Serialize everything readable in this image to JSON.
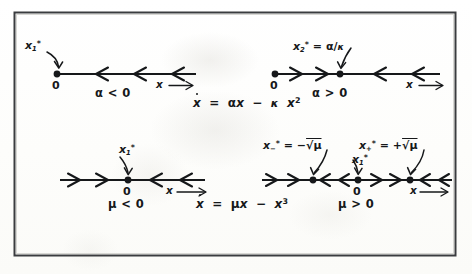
{
  "figure": {
    "background_color": "#fdfdfc",
    "ink_color": "#16181a",
    "frame": {
      "stroke_color": "#3a3c3f",
      "x": 14,
      "y": 12,
      "width": 441,
      "height": 243
    }
  },
  "panels": [
    {
      "id": "transcritical-negative",
      "equation": "ẋ = αx − κ x²",
      "condition": "α < 0",
      "axis_label": "x",
      "axis_arrow": "→",
      "origin_label": "0",
      "fixed_points": [
        {
          "name": "x₁*",
          "base": "x",
          "sub": "1",
          "star": "*",
          "value_text": "",
          "x_px": 57,
          "stability": "stable"
        }
      ],
      "flow_arrows": [
        {
          "direction": "left",
          "x_px": 100
        },
        {
          "direction": "left",
          "x_px": 135
        },
        {
          "direction": "left",
          "x_px": 170
        }
      ],
      "line": {
        "x_start": 57,
        "x_end": 196,
        "y": 74
      }
    },
    {
      "id": "transcritical-positive",
      "equation": "",
      "condition": "α > 0",
      "axis_label": "x",
      "axis_arrow": "→",
      "origin_label": "0",
      "fixed_points": [
        {
          "name": "0",
          "base": "",
          "sub": "",
          "star": "",
          "value_text": "",
          "x_px": 275,
          "stability": "unstable"
        },
        {
          "name": "x₂* = α/κ",
          "base": "x",
          "sub": "2",
          "star": "*",
          "value_text": "= α/κ",
          "x_px": 340,
          "stability": "stable"
        }
      ],
      "flow_arrows": [
        {
          "direction": "right",
          "x_px": 296
        },
        {
          "direction": "right",
          "x_px": 320
        },
        {
          "direction": "left",
          "x_px": 375
        },
        {
          "direction": "left",
          "x_px": 412
        }
      ],
      "line": {
        "x_start": 275,
        "x_end": 440,
        "y": 74
      }
    },
    {
      "id": "pitchfork-negative",
      "equation": "ẋ = μx − x³",
      "condition": "μ < 0",
      "axis_label": "x",
      "axis_arrow": "→",
      "origin_label": "0",
      "fixed_points": [
        {
          "name": "x₁*",
          "base": "x",
          "sub": "1",
          "star": "*",
          "value_text": "",
          "x_px": 128,
          "stability": "stable"
        }
      ],
      "flow_arrows": [
        {
          "direction": "right",
          "x_px": 78
        },
        {
          "direction": "right",
          "x_px": 106
        },
        {
          "direction": "left",
          "x_px": 155
        },
        {
          "direction": "left",
          "x_px": 184
        }
      ],
      "line": {
        "x_start": 60,
        "x_end": 205,
        "y": 180
      }
    },
    {
      "id": "pitchfork-positive",
      "equation": "",
      "condition": "μ > 0",
      "axis_label": "x",
      "axis_arrow": "→",
      "origin_label": "0",
      "fixed_points": [
        {
          "name": "x₋* = −√μ",
          "base": "x",
          "sub": "−",
          "star": "*",
          "value_text": "= −√μ",
          "x_px": 313,
          "stability": "stable"
        },
        {
          "name": "x₁*",
          "base": "x",
          "sub": "1",
          "star": "*",
          "value_text": "",
          "x_px": 358,
          "stability": "unstable"
        },
        {
          "name": "x₊* = +√μ",
          "base": "x",
          "sub": "+",
          "star": "*",
          "value_text": "= +√μ",
          "x_px": 410,
          "stability": "stable"
        }
      ],
      "flow_arrows": [
        {
          "direction": "right",
          "x_px": 272
        },
        {
          "direction": "right",
          "x_px": 295
        },
        {
          "direction": "left",
          "x_px": 330
        },
        {
          "direction": "left",
          "x_px": 344
        },
        {
          "direction": "right",
          "x_px": 381
        },
        {
          "direction": "right",
          "x_px": 396
        },
        {
          "direction": "left",
          "x_px": 427
        },
        {
          "direction": "left",
          "x_px": 442
        }
      ],
      "line": {
        "x_start": 262,
        "x_end": 452,
        "y": 180
      }
    }
  ],
  "equations": {
    "transcritical": "ẋ = αx − κ x²",
    "pitchfork": "ẋ = μx − x³"
  },
  "symbols": {
    "alpha": "α",
    "kappa": "κ",
    "mu": "μ",
    "sqrt": "√",
    "star": "*",
    "minus": "−",
    "plus": "+",
    "less_than": "<",
    "greater_than": ">",
    "equals": "=",
    "arrow_right": "→",
    "zero": "0"
  }
}
